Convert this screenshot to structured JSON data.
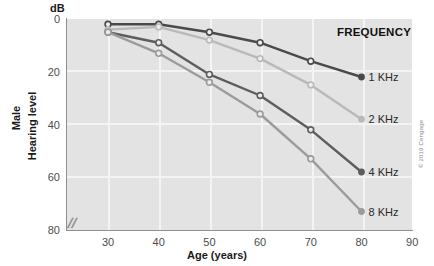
{
  "chart_data": {
    "type": "line",
    "title": "",
    "xlabel": "Age (years)",
    "ylabel": "Hearing level",
    "ylabel_secondary": "Male",
    "yunit": "dB",
    "xlim": [
      20,
      90
    ],
    "ylim": [
      0,
      80
    ],
    "y_inverted": true,
    "xticks": [
      30,
      40,
      50,
      60,
      70,
      80,
      90
    ],
    "yticks": [
      0,
      20,
      40,
      60,
      80
    ],
    "grid": true,
    "legend_position": "right-inline",
    "legend_title": "FREQUENCY",
    "axis_break": "//",
    "x": [
      30,
      40,
      50,
      60,
      70,
      80
    ],
    "series": [
      {
        "name": "1 KHz",
        "values": [
          2,
          2,
          5,
          9,
          16,
          22
        ],
        "color": "#4a4a4a"
      },
      {
        "name": "2 KHz",
        "values": [
          4,
          3,
          8,
          15,
          25,
          38
        ],
        "color": "#b9b9b9"
      },
      {
        "name": "4 KHz",
        "values": [
          5,
          9,
          21,
          29,
          42,
          58
        ],
        "color": "#5d5d5d"
      },
      {
        "name": "8 KHz",
        "values": [
          5,
          13,
          24,
          36,
          53,
          73
        ],
        "color": "#9b9b9b"
      }
    ]
  },
  "axis": {
    "db_label": "dB",
    "x_title": "Age (years)",
    "y_title_male": "Male",
    "y_title_level": "Hearing level",
    "break_mark": "//"
  },
  "legend": {
    "title": "FREQUENCY",
    "items": [
      {
        "label": "1 KHz"
      },
      {
        "label": "2 KHz"
      },
      {
        "label": "4 KHz"
      },
      {
        "label": "8 KHz"
      }
    ]
  },
  "credit": {
    "text": "© 2019 Cengage"
  },
  "colors": {
    "plot_background": "#e3e3e3",
    "gridline": "#f4f4f4",
    "axis": "#8f8f8f",
    "text": "#1a1a1a"
  }
}
